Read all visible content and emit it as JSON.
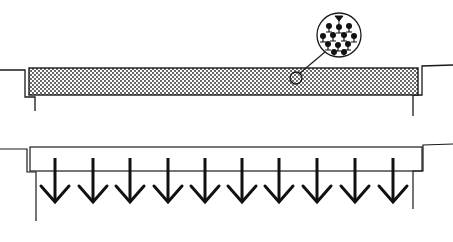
{
  "figure": {
    "kind": "illustration",
    "colors": {
      "ink": "#1a1a1a",
      "background": "#ffffff",
      "stipple": "#222222"
    },
    "top_cutoff_text": "",
    "bottom_cutoff_text": ""
  },
  "top_panel": {
    "description": "Plate filled with stippled material between two ledges, with magnified inset",
    "fill_pattern": "dotted",
    "plate": {
      "x": 29,
      "y": 68,
      "width": 389,
      "height": 27
    },
    "magnifier": {
      "inset_center": [
        339,
        35
      ],
      "inset_radius": 22,
      "spot_center": [
        296,
        78
      ],
      "spot_radius": 6,
      "content": "molecular dipoles / stem-and-bulb particles"
    }
  },
  "bottom_panel": {
    "description": "Empty plate with uniformly distributed downward arrows",
    "plate": {
      "x": 30,
      "y": 148,
      "width": 392,
      "height": 24
    },
    "arrow_count": 10,
    "arrow_x": [
      55,
      93,
      130,
      168,
      205,
      242,
      279,
      317,
      355,
      393
    ],
    "arrow_y_start": 158,
    "arrow_y_end": 202,
    "arrow_direction": "down"
  }
}
